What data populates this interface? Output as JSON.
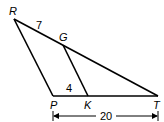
{
  "diagram": {
    "type": "geometry-triangle",
    "points": {
      "R": {
        "label": "R",
        "x": 14,
        "y": 19
      },
      "G": {
        "label": "G",
        "x": 63,
        "y": 44
      },
      "P": {
        "label": "P",
        "x": 53,
        "y": 96
      },
      "K": {
        "label": "K",
        "x": 88,
        "y": 96
      },
      "T": {
        "label": "T",
        "x": 158,
        "y": 96
      }
    },
    "segments": [
      {
        "from": "R",
        "to": "T"
      },
      {
        "from": "R",
        "to": "P"
      },
      {
        "from": "P",
        "to": "T"
      },
      {
        "from": "G",
        "to": "K"
      }
    ],
    "measurements": {
      "RG": "7",
      "PK": "4",
      "PT": "20"
    },
    "colors": {
      "stroke": "#000000",
      "background": "#ffffff"
    }
  }
}
